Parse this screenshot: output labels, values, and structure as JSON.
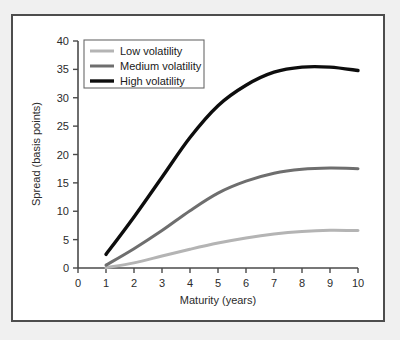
{
  "figure": {
    "background_color": "#ffffff",
    "mat_color": "#f0f0f0",
    "frame_color": "#4d4d4d"
  },
  "chart_data": {
    "type": "line",
    "title": "",
    "xlabel": "Maturity (years)",
    "ylabel": "Spread (basis points)",
    "xlim": [
      0,
      10
    ],
    "ylim": [
      0,
      40
    ],
    "xticks": [
      0,
      1,
      2,
      3,
      4,
      5,
      6,
      7,
      8,
      9,
      10
    ],
    "yticks": [
      0,
      5,
      10,
      15,
      20,
      25,
      30,
      35,
      40
    ],
    "xtick_labels": [
      "0",
      "1",
      "2",
      "3",
      "4",
      "5",
      "6",
      "7",
      "8",
      "9",
      "10"
    ],
    "ytick_labels": [
      "0",
      "5",
      "10",
      "15",
      "20",
      "25",
      "30",
      "35",
      "40"
    ],
    "grid": false,
    "legend_position": "upper left",
    "x": [
      1,
      2,
      3,
      4,
      5,
      6,
      7,
      8,
      9,
      10
    ],
    "series": [
      {
        "name": "Low volatility",
        "color": "#b4b4b4",
        "line_width": 3.0,
        "values": [
          0.05,
          0.9,
          2.1,
          3.3,
          4.4,
          5.3,
          6.0,
          6.45,
          6.65,
          6.6
        ]
      },
      {
        "name": "Medium volatility",
        "color": "#6e6e6e",
        "line_width": 3.0,
        "values": [
          0.5,
          3.4,
          6.6,
          10.1,
          13.2,
          15.3,
          16.7,
          17.4,
          17.6,
          17.5
        ]
      },
      {
        "name": "High volatility",
        "color": "#0d0d0d",
        "line_width": 3.4,
        "values": [
          2.4,
          9.0,
          16.0,
          23.0,
          28.6,
          32.2,
          34.5,
          35.4,
          35.4,
          34.8
        ]
      }
    ]
  },
  "legend": {
    "entries": [
      {
        "label": "Low volatility"
      },
      {
        "label": "Medium volatility"
      },
      {
        "label": "High volatility"
      }
    ]
  }
}
